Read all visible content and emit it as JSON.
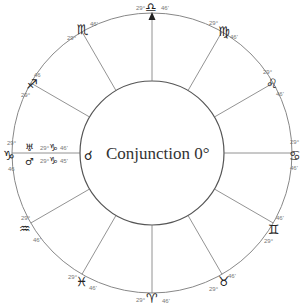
{
  "center": {
    "aspect_glyph": "☌",
    "aspect_icon": "conjunction-icon",
    "label": "Conjunction 0°"
  },
  "signs": [
    {
      "name": "Libra",
      "glyph": "♎",
      "deg": "29°",
      "min": "46'",
      "position": "top"
    },
    {
      "name": "Virgo",
      "glyph": "♍",
      "deg": "29°",
      "min": "46'",
      "position": "upper-right"
    },
    {
      "name": "Leo",
      "glyph": "♌",
      "deg": "29°",
      "min": "46'",
      "position": "right-upper"
    },
    {
      "name": "Cancer",
      "glyph": "♋",
      "deg": "29°",
      "min": "46'",
      "position": "right"
    },
    {
      "name": "Gemini",
      "glyph": "♊",
      "deg": "29°",
      "min": "46'",
      "position": "right-lower"
    },
    {
      "name": "Taurus",
      "glyph": "♉",
      "deg": "29°",
      "min": "46'",
      "position": "lower-right"
    },
    {
      "name": "Aries",
      "glyph": "♈",
      "deg": "29°",
      "min": "46'",
      "position": "bottom"
    },
    {
      "name": "Pisces",
      "glyph": "♓",
      "deg": "29°",
      "min": "46'",
      "position": "lower-left"
    },
    {
      "name": "Aquarius",
      "glyph": "♒",
      "deg": "29°",
      "min": "46'",
      "position": "left-lower"
    },
    {
      "name": "Capricorn",
      "glyph": "♑",
      "deg": "29°",
      "min": "46",
      "position": "left"
    },
    {
      "name": "Sagittarius",
      "glyph": "♐",
      "deg": "29°",
      "min": "46",
      "position": "left-upper"
    },
    {
      "name": "Scorpio",
      "glyph": "♏",
      "deg": "29°",
      "min": "46'",
      "position": "upper-left"
    }
  ],
  "planets": [
    {
      "name": "Uranus",
      "glyph": "♅",
      "sign_glyph": "♑",
      "deg": "29°",
      "min": "46'"
    },
    {
      "name": "Mars",
      "glyph": "♂",
      "sign_glyph": "♑",
      "deg": "29°",
      "min": "45'"
    }
  ],
  "colors": {
    "line": "#777777",
    "ring": "#888888",
    "inner_ring": "#555555",
    "glyph": "#222222",
    "text": "#333333"
  }
}
